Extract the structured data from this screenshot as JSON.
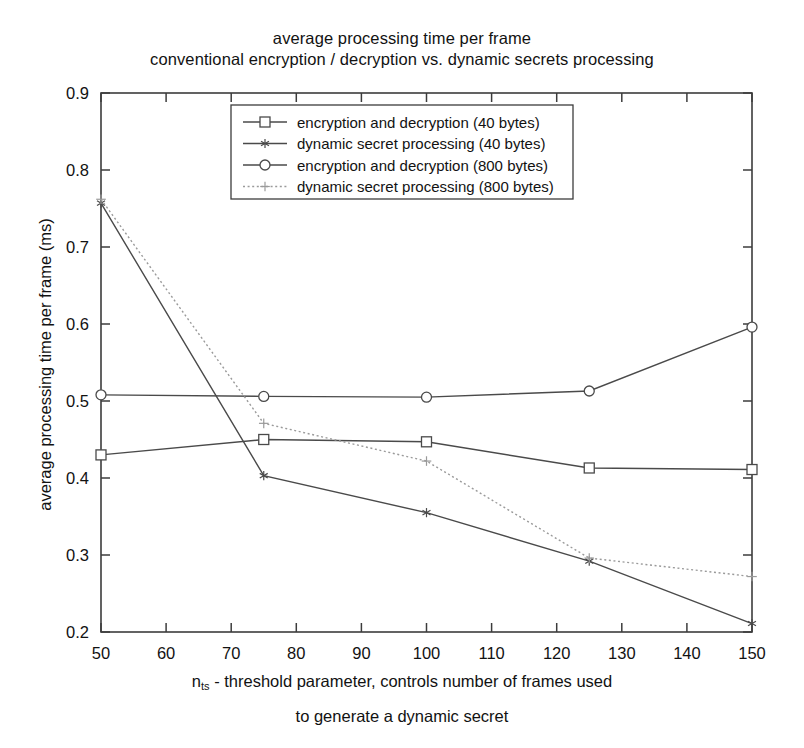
{
  "chart_data": {
    "type": "line",
    "title": "average processing time per frame",
    "subtitle": "conventional encryption / decryption vs. dynamic secrets processing",
    "xlabel_line1": "n_ts - threshold parameter, controls number of frames used",
    "xlabel_line2": "to generate a dynamic secret",
    "xlabel_symbol": "n",
    "xlabel_subscript": "ts",
    "xlabel_rest": " - threshold parameter, controls number of frames used",
    "ylabel": "average processing time per frame (ms)",
    "xlim": [
      50,
      150
    ],
    "ylim": [
      0.2,
      0.9
    ],
    "xticks": [
      50,
      60,
      70,
      80,
      90,
      100,
      110,
      120,
      130,
      140,
      150
    ],
    "yticks": [
      0.2,
      0.3,
      0.4,
      0.5,
      0.6,
      0.7,
      0.8,
      0.9
    ],
    "xtick_labels": [
      "50",
      "60",
      "70",
      "80",
      "90",
      "100",
      "110",
      "120",
      "130",
      "140",
      "150"
    ],
    "ytick_labels": [
      "0.2",
      "0.3",
      "0.4",
      "0.5",
      "0.6",
      "0.7",
      "0.8",
      "0.9"
    ],
    "grid": false,
    "legend_position": "upper center",
    "x": [
      50,
      75,
      100,
      125,
      150
    ],
    "series": [
      {
        "name": "encryption and decryption (40 bytes)",
        "marker": "square",
        "linestyle": "solid",
        "color": "#4a4a4a",
        "values": [
          0.43,
          0.45,
          0.447,
          0.413,
          0.411
        ]
      },
      {
        "name": "dynamic secret processing (40 bytes)",
        "marker": "star",
        "linestyle": "solid",
        "color": "#4a4a4a",
        "values": [
          0.757,
          0.403,
          0.355,
          0.292,
          0.211
        ]
      },
      {
        "name": "encryption and decryption (800 bytes)",
        "marker": "circle",
        "linestyle": "solid",
        "color": "#4a4a4a",
        "values": [
          0.508,
          0.506,
          0.505,
          0.513,
          0.596
        ]
      },
      {
        "name": "dynamic secret processing (800 bytes)",
        "marker": "plus",
        "linestyle": "dotted",
        "color": "#9a9a9a",
        "values": [
          0.762,
          0.471,
          0.422,
          0.296,
          0.272
        ]
      }
    ]
  },
  "legend": {
    "entries": [
      "encryption and decryption (40 bytes)",
      "dynamic secret processing (40 bytes)",
      "encryption and decryption (800 bytes)",
      "dynamic secret processing (800 bytes)"
    ]
  }
}
